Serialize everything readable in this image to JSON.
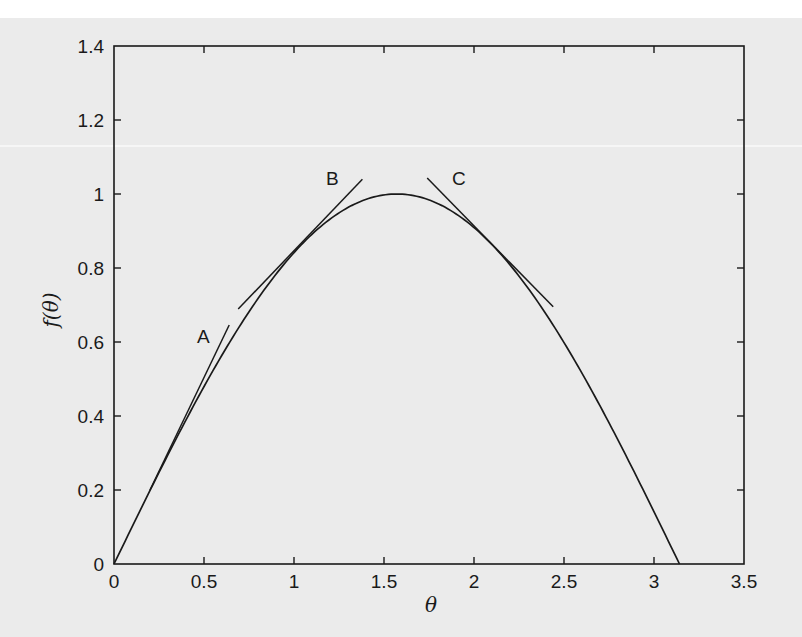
{
  "chart_data": {
    "type": "line",
    "title": "",
    "xlabel": "θ",
    "ylabel": "f(θ)",
    "xlim": [
      0,
      3.5
    ],
    "ylim": [
      0,
      1.4
    ],
    "xticks": [
      "0",
      "0.5",
      "1",
      "1.5",
      "2",
      "2.5",
      "3",
      "3.5"
    ],
    "yticks": [
      "0",
      "0.2",
      "0.4",
      "0.6",
      "0.8",
      "1",
      "1.2",
      "1.4"
    ],
    "grid": false,
    "legend": null,
    "series": [
      {
        "name": "f(θ) = sin θ",
        "x": [
          0,
          0.25,
          0.5,
          0.75,
          1.0,
          1.25,
          1.5,
          1.5708,
          1.75,
          2.0,
          2.25,
          2.5,
          2.75,
          3.0,
          3.1416
        ],
        "values": [
          0,
          0.247,
          0.479,
          0.682,
          0.841,
          0.949,
          0.997,
          1.0,
          0.984,
          0.909,
          0.778,
          0.598,
          0.382,
          0.141,
          0
        ]
      }
    ],
    "tangent_lines": [
      {
        "label": "A",
        "x": [
          0.2,
          0.64
        ],
        "y": [
          0.2,
          0.646
        ]
      },
      {
        "label": "B",
        "x": [
          0.69,
          1.38
        ],
        "y": [
          0.689,
          1.04
        ]
      },
      {
        "label": "C",
        "x": [
          1.74,
          2.44
        ],
        "y": [
          1.043,
          0.695
        ]
      }
    ],
    "annotations": [
      {
        "text": "A",
        "x": 0.5,
        "y": 0.62
      },
      {
        "text": "B",
        "x": 1.22,
        "y": 1.04
      },
      {
        "text": "C",
        "x": 1.88,
        "y": 1.04
      }
    ]
  },
  "labels": {
    "x_axis": "θ",
    "y_axis": "f(θ)",
    "annotation_a": "A",
    "annotation_b": "B",
    "annotation_c": "C",
    "xticks": [
      "0",
      "0.5",
      "1",
      "1.5",
      "2",
      "2.5",
      "3",
      "3.5"
    ],
    "yticks": [
      "0",
      "0.2",
      "0.4",
      "0.6",
      "0.8",
      "1",
      "1.2",
      "1.4"
    ]
  },
  "colors": {
    "background": "#ebebeb",
    "ink": "#1a1a1a"
  }
}
